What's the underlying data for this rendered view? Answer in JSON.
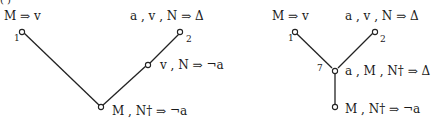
{
  "figure": {
    "caption_fragment": "( )",
    "left_tree": {
      "nodes": [
        {
          "id": "1",
          "label": "1",
          "sequent": "M ⇒ v"
        },
        {
          "id": "2",
          "label": "2",
          "sequent": "a , v , N ⇒ Δ"
        },
        {
          "id": "mid",
          "label": "",
          "sequent": "v , N ⇒ ¬a"
        },
        {
          "id": "root",
          "label": "",
          "sequent": "M , N† ⇒ ¬a"
        }
      ]
    },
    "right_tree": {
      "nodes": [
        {
          "id": "1",
          "label": "1",
          "sequent": "M ⇒ v"
        },
        {
          "id": "2",
          "label": "2",
          "sequent": "a , v , N ⇒ Δ"
        },
        {
          "id": "7",
          "label": "7",
          "sequent": "a , M , N† ⇒ Δ"
        },
        {
          "id": "root",
          "label": "",
          "sequent": "M , N† ⇒ ¬a"
        }
      ]
    }
  }
}
